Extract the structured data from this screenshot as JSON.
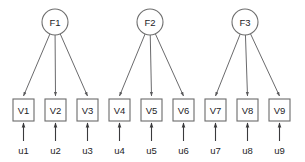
{
  "diagram": {
    "colors": {
      "background": "#ffffff",
      "circle_stroke": "#6e6e6e",
      "box_stroke": "#6b6b6b",
      "loading_arrow": "#59595b",
      "residual_arrow": "#3a3a3c",
      "text": "#1d1d1f"
    },
    "factors": [
      {
        "id": "F1",
        "label": "F1",
        "cx": 55,
        "cy": 22,
        "r": 13
      },
      {
        "id": "F2",
        "label": "F2",
        "cx": 150,
        "cy": 22,
        "r": 13
      },
      {
        "id": "F3",
        "label": "F3",
        "cx": 245,
        "cy": 22,
        "r": 13
      }
    ],
    "indicators": [
      {
        "id": "V1",
        "label": "V1",
        "x": 13,
        "y": 99,
        "w": 21,
        "h": 22,
        "cx": 23.5
      },
      {
        "id": "V2",
        "label": "V2",
        "x": 45,
        "y": 99,
        "w": 21,
        "h": 22,
        "cx": 55.5
      },
      {
        "id": "V3",
        "label": "V3",
        "x": 77,
        "y": 99,
        "w": 21,
        "h": 22,
        "cx": 87.5
      },
      {
        "id": "V4",
        "label": "V4",
        "x": 109,
        "y": 99,
        "w": 21,
        "h": 22,
        "cx": 119.5
      },
      {
        "id": "V5",
        "label": "V5",
        "x": 141,
        "y": 99,
        "w": 21,
        "h": 22,
        "cx": 151.5
      },
      {
        "id": "V6",
        "label": "V6",
        "x": 173,
        "y": 99,
        "w": 21,
        "h": 22,
        "cx": 183.5
      },
      {
        "id": "V7",
        "label": "V7",
        "x": 205,
        "y": 99,
        "w": 21,
        "h": 22,
        "cx": 215.5
      },
      {
        "id": "V8",
        "label": "V8",
        "x": 237,
        "y": 99,
        "w": 21,
        "h": 22,
        "cx": 247.5
      },
      {
        "id": "V9",
        "label": "V9",
        "x": 269,
        "y": 99,
        "w": 21,
        "h": 22,
        "cx": 279.5
      }
    ],
    "residuals": [
      {
        "id": "u1",
        "label": "u1",
        "cx": 23.5,
        "label_y": 150,
        "arrow_from_y": 141,
        "arrow_to_y": 123
      },
      {
        "id": "u2",
        "label": "u2",
        "cx": 55.5,
        "label_y": 150,
        "arrow_from_y": 141,
        "arrow_to_y": 123
      },
      {
        "id": "u3",
        "label": "u3",
        "cx": 87.5,
        "label_y": 150,
        "arrow_from_y": 141,
        "arrow_to_y": 123
      },
      {
        "id": "u4",
        "label": "u4",
        "cx": 119.5,
        "label_y": 150,
        "arrow_from_y": 141,
        "arrow_to_y": 123
      },
      {
        "id": "u5",
        "label": "u5",
        "cx": 151.5,
        "label_y": 150,
        "arrow_from_y": 141,
        "arrow_to_y": 123
      },
      {
        "id": "u6",
        "label": "u6",
        "cx": 183.5,
        "label_y": 150,
        "arrow_from_y": 141,
        "arrow_to_y": 123
      },
      {
        "id": "u7",
        "label": "u7",
        "cx": 215.5,
        "label_y": 150,
        "arrow_from_y": 141,
        "arrow_to_y": 123
      },
      {
        "id": "u8",
        "label": "u8",
        "cx": 247.5,
        "label_y": 150,
        "arrow_from_y": 141,
        "arrow_to_y": 123
      },
      {
        "id": "u9",
        "label": "u9",
        "cx": 279.5,
        "label_y": 150,
        "arrow_from_y": 141,
        "arrow_to_y": 123
      }
    ],
    "loadings": [
      {
        "from": "F1",
        "to": "V1"
      },
      {
        "from": "F1",
        "to": "V2"
      },
      {
        "from": "F1",
        "to": "V3"
      },
      {
        "from": "F2",
        "to": "V4"
      },
      {
        "from": "F2",
        "to": "V5"
      },
      {
        "from": "F2",
        "to": "V6"
      },
      {
        "from": "F3",
        "to": "V7"
      },
      {
        "from": "F3",
        "to": "V8"
      },
      {
        "from": "F3",
        "to": "V9"
      }
    ]
  }
}
